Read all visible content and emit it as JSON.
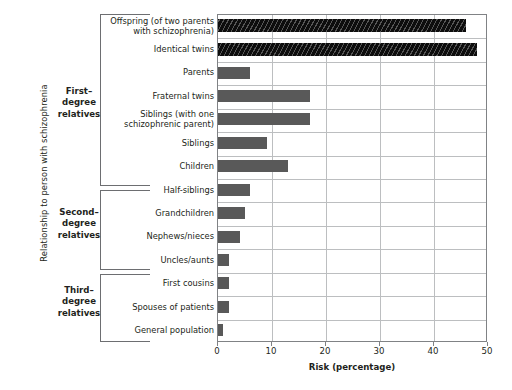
{
  "chart_data": {
    "type": "bar",
    "orientation": "horizontal",
    "title": "",
    "xlabel": "Risk (percentage)",
    "ylabel": "Relationship to person with schizophrenia",
    "xlim": [
      0,
      50
    ],
    "xticks": [
      0,
      10,
      20,
      30,
      40,
      50
    ],
    "xtick_labels": [
      "0",
      "10",
      "20",
      "30",
      "40",
      "50"
    ],
    "grid": "vertical and horizontal",
    "legend": "none",
    "categories": [
      "Offspring (of two parents with schizophrenia)",
      "Identical twins",
      "Parents",
      "Fraternal twins",
      "Siblings (with one schizophrenic parent)",
      "Siblings",
      "Children",
      "Half-siblings",
      "Grandchildren",
      "Nephews/nieces",
      "Uncles/aunts",
      "First cousins",
      "Spouses  of patients",
      "General population"
    ],
    "values": [
      46,
      48,
      6,
      17,
      17,
      9,
      13,
      6,
      5,
      4,
      2,
      2,
      2,
      1
    ],
    "bar_colors": [
      "#0d0d0d",
      "#0d0d0d",
      "#595959",
      "#595959",
      "#595959",
      "#595959",
      "#595959",
      "#595959",
      "#595959",
      "#595959",
      "#595959",
      "#595959",
      "#595959",
      "#595959"
    ],
    "bar_styles": [
      "hatched",
      "hatched",
      "solid",
      "solid",
      "solid",
      "solid",
      "solid",
      "solid",
      "solid",
      "solid",
      "solid",
      "solid",
      "solid",
      "solid"
    ]
  },
  "bars": [
    {
      "label_line1": "Offspring (of two parents",
      "label_line2": "with schizophrenia)",
      "value": 46,
      "style": "hatched"
    },
    {
      "label_line1": "Identical twins",
      "label_line2": "",
      "value": 48,
      "style": "hatched"
    },
    {
      "label_line1": "Parents",
      "label_line2": "",
      "value": 6,
      "style": "solid"
    },
    {
      "label_line1": "Fraternal twins",
      "label_line2": "",
      "value": 17,
      "style": "solid"
    },
    {
      "label_line1": "Siblings (with one",
      "label_line2": "schizophrenic parent)",
      "value": 17,
      "style": "solid"
    },
    {
      "label_line1": "Siblings",
      "label_line2": "",
      "value": 9,
      "style": "solid"
    },
    {
      "label_line1": "Children",
      "label_line2": "",
      "value": 13,
      "style": "solid"
    },
    {
      "label_line1": "Half-siblings",
      "label_line2": "",
      "value": 6,
      "style": "solid"
    },
    {
      "label_line1": "Grandchildren",
      "label_line2": "",
      "value": 5,
      "style": "solid"
    },
    {
      "label_line1": "Nephews/nieces",
      "label_line2": "",
      "value": 4,
      "style": "solid"
    },
    {
      "label_line1": "Uncles/aunts",
      "label_line2": "",
      "value": 2,
      "style": "solid"
    },
    {
      "label_line1": "First cousins",
      "label_line2": "",
      "value": 2,
      "style": "solid"
    },
    {
      "label_line1": "Spouses  of patients",
      "label_line2": "",
      "value": 2,
      "style": "solid"
    },
    {
      "label_line1": "General population",
      "label_line2": "",
      "value": 1,
      "style": "solid"
    }
  ],
  "groups": [
    {
      "line1": "First–",
      "line2": "degree",
      "line3": "relatives"
    },
    {
      "line1": "Second–",
      "line2": "degree",
      "line3": "relatives"
    },
    {
      "line1": "Third–",
      "line2": "degree",
      "line3": "relatives"
    }
  ],
  "axes": {
    "y_title": "Relationship to person with schizophrenia",
    "x_title": "Risk (percentage)",
    "x_tick_labels": [
      "0",
      "10",
      "20",
      "30",
      "40",
      "50"
    ]
  },
  "colors": {
    "bar_gray": "#595959",
    "bar_black": "#0d0d0d",
    "grid": "#bcbec0",
    "frame": "#808285",
    "text": "#231f20"
  }
}
